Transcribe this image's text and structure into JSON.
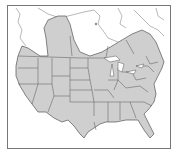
{
  "map": {
    "type": "range-map",
    "region": "North America (United States and southern Canada)",
    "legend": [],
    "colors": {
      "range_fill": "#cfcfcf",
      "outside_fill": "#ffffff",
      "borders": "#555555",
      "frame": "#777777"
    }
  }
}
